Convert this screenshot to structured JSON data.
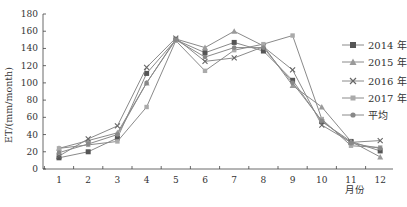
{
  "chart_data": {
    "type": "line",
    "title": "",
    "xlabel": "月份",
    "ylabel": "ET/(mm/month)",
    "ylim": [
      0,
      180
    ],
    "yticks": [
      0,
      20,
      40,
      60,
      80,
      100,
      120,
      140,
      160,
      180
    ],
    "categories": [
      "1",
      "2",
      "3",
      "4",
      "5",
      "6",
      "7",
      "8",
      "9",
      "10",
      "11",
      "12"
    ],
    "x": [
      1,
      2,
      3,
      4,
      5,
      6,
      7,
      8,
      9,
      10,
      11,
      12
    ],
    "grid": false,
    "legend_position": "right",
    "series": [
      {
        "name": "2014 年",
        "marker": "square",
        "values": [
          13,
          20,
          36,
          111,
          150,
          135,
          147,
          137,
          103,
          55,
          32,
          21
        ]
      },
      {
        "name": "2015 年",
        "marker": "triangle",
        "values": [
          24,
          33,
          42,
          100,
          151,
          141,
          160,
          143,
          97,
          72,
          32,
          14
        ]
      },
      {
        "name": "2016 年",
        "marker": "x",
        "values": [
          15,
          35,
          50,
          118,
          152,
          125,
          129,
          142,
          115,
          51,
          31,
          33
        ]
      },
      {
        "name": "2017 年",
        "marker": "diamond",
        "values": [
          24,
          28,
          32,
          72,
          149,
          114,
          138,
          145,
          155,
          58,
          27,
          25
        ]
      },
      {
        "name": "平均",
        "marker": "circle",
        "values": [
          19,
          29,
          40,
          100,
          150,
          130,
          141,
          141,
          100,
          56,
          30,
          24
        ]
      }
    ]
  },
  "legend": {
    "items": [
      "2014 年",
      "2015 年",
      "2016 年",
      "2017 年",
      "平均"
    ]
  },
  "axes": {
    "xlabel": "月份",
    "ylabel": "ET/(mm/month)"
  },
  "colors": {
    "line": "#8a8a8a",
    "marker_dark": "#555555",
    "axis": "#444444",
    "text": "#333333"
  }
}
